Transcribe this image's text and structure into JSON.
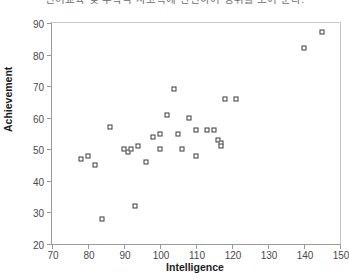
{
  "caption": "언어교육 및 수학적 사고력에 관련하여 성취를 보여 준다.",
  "chart_data": {
    "type": "scatter",
    "title": "",
    "xlabel": "Intelligence",
    "ylabel": "Achievement",
    "xlim": [
      70,
      150
    ],
    "ylim": [
      20,
      90
    ],
    "xticks": [
      70,
      80,
      90,
      100,
      110,
      120,
      130,
      140,
      150
    ],
    "yticks": [
      20,
      30,
      40,
      50,
      60,
      70,
      80,
      90
    ],
    "grid": false,
    "legend": null,
    "marker": "open-square",
    "marker_color": "#3a3a3a",
    "points": [
      {
        "x": 78,
        "y": 47
      },
      {
        "x": 80,
        "y": 48
      },
      {
        "x": 82,
        "y": 45
      },
      {
        "x": 84,
        "y": 28
      },
      {
        "x": 86,
        "y": 57
      },
      {
        "x": 90,
        "y": 50
      },
      {
        "x": 91,
        "y": 49
      },
      {
        "x": 92,
        "y": 50
      },
      {
        "x": 93,
        "y": 32
      },
      {
        "x": 94,
        "y": 51
      },
      {
        "x": 96,
        "y": 46
      },
      {
        "x": 98,
        "y": 54
      },
      {
        "x": 100,
        "y": 55
      },
      {
        "x": 100,
        "y": 50
      },
      {
        "x": 102,
        "y": 61
      },
      {
        "x": 104,
        "y": 69
      },
      {
        "x": 105,
        "y": 55
      },
      {
        "x": 106,
        "y": 50
      },
      {
        "x": 108,
        "y": 60
      },
      {
        "x": 110,
        "y": 56
      },
      {
        "x": 110,
        "y": 48
      },
      {
        "x": 113,
        "y": 56
      },
      {
        "x": 115,
        "y": 56
      },
      {
        "x": 116,
        "y": 53
      },
      {
        "x": 117,
        "y": 52
      },
      {
        "x": 117,
        "y": 51
      },
      {
        "x": 118,
        "y": 66
      },
      {
        "x": 121,
        "y": 66
      },
      {
        "x": 140,
        "y": 82
      },
      {
        "x": 145,
        "y": 87
      }
    ]
  }
}
